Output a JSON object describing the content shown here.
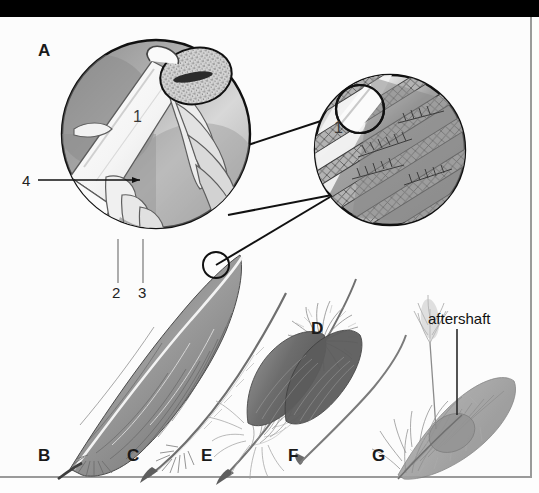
{
  "figure": {
    "title_bar_color": "#000000",
    "background_color": "#fdfdfd",
    "border_color": "#9a9a9a",
    "ink_color": "#1a1a1a"
  },
  "panels": {
    "a": "A",
    "b": "B",
    "c": "C",
    "d": "D",
    "e": "E",
    "f": "F",
    "g": "G"
  },
  "callouts": {
    "one_left": "1",
    "one_right": "1",
    "two": "2",
    "three": "3",
    "four": "4"
  },
  "annotations": {
    "aftershaft": "aftershaft"
  }
}
